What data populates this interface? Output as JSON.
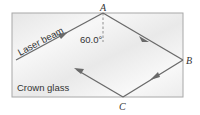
{
  "diagram": {
    "medium_label": "Crown glass",
    "beam_label": "Laser beam",
    "angle_label": "60.0°",
    "points": {
      "A": "A",
      "B": "B",
      "C": "C"
    },
    "colors": {
      "glass_fill": "#eeeeee",
      "glass_border": "#9a9a9a",
      "ray": "#6a6a6a",
      "text": "#333333"
    }
  }
}
